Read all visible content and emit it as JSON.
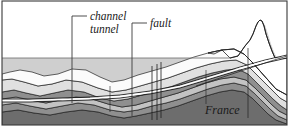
{
  "figure": {
    "type": "geological-cross-section",
    "title_visible": false,
    "labels": {
      "channel_tunnel_line1": "channel",
      "channel_tunnel_line2": "tunnel",
      "fault": "fault",
      "country": "France"
    },
    "annotations": [
      {
        "name": "channel-tunnel",
        "text": "channel tunnel",
        "leader_from_x": 57,
        "leader_from_y": 16,
        "leader_elbow_x": 72,
        "leader_to_y": 103
      },
      {
        "name": "fault",
        "text": "fault",
        "leader_from_x": 144,
        "leader_from_y": 23,
        "leader_elbow_x": 132,
        "leader_to_y": 116
      }
    ],
    "colors": {
      "sea": "#cfcfcf",
      "sky": "#ffffff",
      "stratum_light": "#e6e6e6",
      "stratum_mid": "#c3c3c3",
      "stratum_dark": "#8f8f8f",
      "stratum_darkest": "#6d6d6d",
      "stratum_white": "#fbfbfb",
      "outline": "#1f1f1f",
      "frame": "#3a3a3a",
      "label_text": "#1a1a1a"
    },
    "geometry": {
      "frame": {
        "x": 2,
        "y": 1,
        "width": 285,
        "height": 124
      },
      "sea_level_y": 58,
      "seabed_notes": "undulating seabed below sea level rising to coastal cliff and hill at right",
      "fault_vertical_lines_x": [
        152,
        157,
        161
      ],
      "fault_offset_px": 4
    },
    "elements": {
      "sea_layer": "light grey water body from sea level down to seabed, left two thirds",
      "hill": "prominent peak at right side above sea level, apex near x=262 y=22",
      "tunnel": "pair of near-parallel lines running left to right, shallow through the chalk, rising toward right coast",
      "strata_count": 6
    }
  }
}
